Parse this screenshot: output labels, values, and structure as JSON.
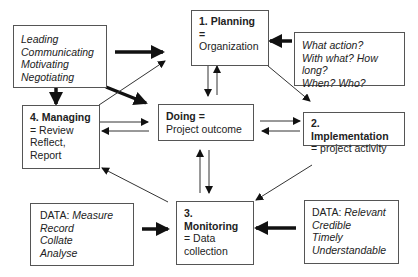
{
  "diagram": {
    "boxes": {
      "skills": {
        "lines": [
          "Leading",
          "Communicating",
          "Motivating",
          "Negotiating"
        ]
      },
      "planning": {
        "title": "1. Planning =",
        "subtitle": "Organization"
      },
      "questions": {
        "lines": [
          "What action?",
          "With what? How long?",
          "When? Who?"
        ]
      },
      "managing": {
        "title": "4. Managing",
        "lines": [
          "= Review",
          "Reflect,",
          "Report"
        ]
      },
      "doing": {
        "title": "Doing =",
        "subtitle": "Project outcome"
      },
      "implementation": {
        "title": "2. Implementation",
        "subtitle": "= project activity"
      },
      "monitoring": {
        "title": "3. Monitoring",
        "lines": [
          "= Data",
          "collection"
        ]
      },
      "data_left": {
        "prefix": "DATA: ",
        "first": "Measure",
        "lines": [
          "Record",
          "Collate",
          "Analyse"
        ]
      },
      "data_right": {
        "prefix": "DATA: ",
        "first": "Relevant",
        "lines": [
          "Credible",
          "Timely",
          "Understandable"
        ]
      }
    },
    "colors": {
      "border": "#555555",
      "arrow": "#111111",
      "text": "#222222"
    }
  }
}
